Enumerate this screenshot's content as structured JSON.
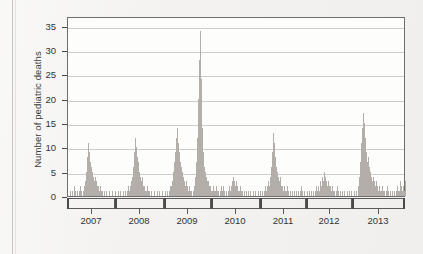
{
  "figure": {
    "background_color": "#f2f1ef",
    "plot_background_color": "#fdfdfc",
    "bar_color": "#b3aeaa",
    "axis_color": "#5a5a5a",
    "grid_color": "#cfcdca"
  },
  "chart_data": {
    "type": "bar",
    "title": "",
    "subtitle": "",
    "xlabel": "",
    "ylabel": "Number of pediatric deaths",
    "ylim": [
      0,
      37
    ],
    "yticks": [
      0,
      5,
      10,
      15,
      20,
      25,
      30,
      35
    ],
    "ytick_labels": [
      "0",
      "5",
      "10",
      "15",
      "20",
      "25",
      "30",
      "35"
    ],
    "grid": "horizontal",
    "legend": "none",
    "xtick_labels": [
      "2007",
      "2008",
      "2009",
      "2010",
      "2011",
      "2012",
      "2013"
    ],
    "x_segment_boundaries_px": [
      0,
      48,
      97,
      144,
      193,
      239,
      285,
      338
    ],
    "x_label_centers_px": [
      24,
      72,
      120,
      168,
      216,
      262,
      311
    ],
    "x_description": "Weekly counts grouped into influenza-season segments labeled by year, 2007 through 2013",
    "series": [
      {
        "name": "Weekly pediatric influenza deaths",
        "values": [
          0,
          0,
          1,
          0,
          1,
          0,
          2,
          1,
          0,
          1,
          0,
          1,
          2,
          1,
          0,
          1,
          2,
          3,
          5,
          8,
          11,
          9,
          7,
          6,
          5,
          4,
          3,
          4,
          3,
          2,
          2,
          1,
          2,
          1,
          1,
          0,
          1,
          0,
          1,
          0,
          0,
          1,
          0,
          0,
          1,
          0,
          0,
          1,
          0,
          0,
          1,
          0,
          1,
          0,
          0,
          1,
          0,
          1,
          0,
          1,
          2,
          1,
          2,
          3,
          4,
          6,
          9,
          12,
          10,
          8,
          7,
          5,
          4,
          3,
          4,
          2,
          2,
          1,
          1,
          2,
          1,
          1,
          0,
          1,
          0,
          0,
          1,
          0,
          0,
          1,
          0,
          1,
          0,
          0,
          1,
          0,
          0,
          1,
          0,
          1,
          0,
          1,
          2,
          2,
          3,
          5,
          7,
          9,
          12,
          14,
          11,
          9,
          7,
          6,
          5,
          4,
          3,
          2,
          3,
          2,
          1,
          2,
          1,
          1,
          0,
          1,
          2,
          4,
          7,
          12,
          20,
          28,
          34,
          24,
          14,
          9,
          6,
          5,
          4,
          3,
          3,
          2,
          2,
          1,
          1,
          2,
          1,
          1,
          2,
          1,
          1,
          0,
          1,
          2,
          1,
          2,
          1,
          0,
          1,
          0,
          1,
          2,
          1,
          2,
          3,
          4,
          3,
          2,
          3,
          2,
          1,
          1,
          2,
          1,
          1,
          0,
          1,
          0,
          1,
          0,
          1,
          0,
          1,
          0,
          0,
          1,
          0,
          1,
          0,
          0,
          1,
          0,
          1,
          0,
          1,
          0,
          1,
          2,
          1,
          2,
          3,
          2,
          4,
          6,
          9,
          13,
          11,
          8,
          6,
          5,
          4,
          3,
          4,
          2,
          2,
          1,
          2,
          1,
          1,
          2,
          1,
          0,
          1,
          0,
          1,
          0,
          1,
          0,
          1,
          0,
          1,
          0,
          1,
          2,
          1,
          0,
          1,
          0,
          0,
          1,
          0,
          1,
          0,
          1,
          0,
          1,
          0,
          1,
          2,
          1,
          2,
          1,
          3,
          2,
          4,
          3,
          5,
          4,
          3,
          2,
          3,
          2,
          2,
          1,
          2,
          1,
          1,
          0,
          1,
          2,
          1,
          0,
          1,
          0,
          1,
          0,
          1,
          0,
          0,
          1,
          0,
          1,
          0,
          1,
          0,
          0,
          1,
          0,
          1,
          0,
          2,
          4,
          7,
          11,
          14,
          17,
          15,
          12,
          9,
          7,
          8,
          6,
          5,
          4,
          3,
          4,
          3,
          2,
          3,
          2,
          1,
          2,
          1,
          1,
          2,
          1,
          1,
          0,
          1,
          2,
          1,
          0,
          1,
          0,
          1,
          0,
          1,
          0,
          1,
          2,
          1,
          1,
          3,
          2,
          1,
          2,
          1,
          3
        ]
      }
    ]
  }
}
